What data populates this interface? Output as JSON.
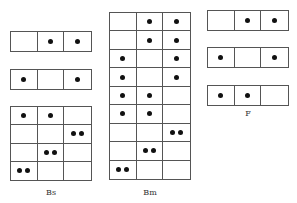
{
  "diagram": {
    "grids": [
      {
        "id": "left-row-1",
        "x": 10,
        "y": 31,
        "w": 82,
        "h": 21,
        "rows": [
          [
            0,
            1,
            1
          ]
        ]
      },
      {
        "id": "left-row-2",
        "x": 10,
        "y": 69,
        "w": 82,
        "h": 21,
        "rows": [
          [
            1,
            0,
            1
          ]
        ]
      },
      {
        "id": "bs-grid",
        "x": 10,
        "y": 106,
        "w": 82,
        "h": 75,
        "rows": [
          [
            1,
            1,
            0
          ],
          [
            0,
            0,
            2
          ],
          [
            0,
            2,
            0
          ],
          [
            2,
            0,
            0
          ]
        ]
      },
      {
        "id": "bm-grid",
        "x": 109,
        "y": 12,
        "w": 82,
        "h": 168,
        "rows": [
          [
            0,
            1,
            1
          ],
          [
            0,
            1,
            1
          ],
          [
            1,
            0,
            1
          ],
          [
            1,
            0,
            1
          ],
          [
            1,
            1,
            0
          ],
          [
            1,
            1,
            0
          ],
          [
            0,
            0,
            2
          ],
          [
            0,
            2,
            0
          ],
          [
            2,
            0,
            0
          ]
        ]
      },
      {
        "id": "f-row-1",
        "x": 207,
        "y": 10,
        "w": 82,
        "h": 21,
        "rows": [
          [
            0,
            1,
            1
          ]
        ]
      },
      {
        "id": "f-row-2",
        "x": 207,
        "y": 47,
        "w": 82,
        "h": 21,
        "rows": [
          [
            1,
            0,
            1
          ]
        ]
      },
      {
        "id": "f-row-3",
        "x": 207,
        "y": 85,
        "w": 82,
        "h": 21,
        "rows": [
          [
            1,
            1,
            0
          ]
        ]
      }
    ],
    "labels": [
      {
        "id": "label-bs",
        "text": "Bs",
        "x": 51,
        "y": 188
      },
      {
        "id": "label-bm",
        "text": "Bm",
        "x": 150,
        "y": 188
      },
      {
        "id": "label-f",
        "text": "F",
        "x": 248,
        "y": 109
      }
    ]
  }
}
